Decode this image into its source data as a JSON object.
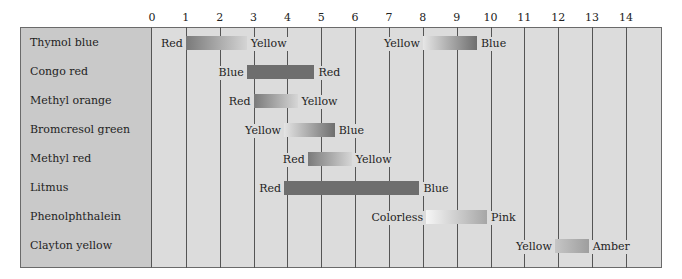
{
  "chart_data": {
    "type": "range-bar",
    "title": "",
    "xlabel": "pH",
    "ylabel": "",
    "xlim": [
      0,
      15
    ],
    "x_ticks": [
      0,
      1,
      2,
      3,
      4,
      5,
      6,
      7,
      8,
      9,
      10,
      11,
      12,
      13,
      14
    ],
    "grid": true,
    "legend": null,
    "indicators": [
      {
        "name": "Thymol blue",
        "ranges": [
          {
            "low": 1.0,
            "high": 2.8,
            "low_color_label": "Red",
            "high_color_label": "Yellow",
            "gradient": [
              "#7a7a7a",
              "#d4d4d4"
            ]
          },
          {
            "low": 8.0,
            "high": 9.6,
            "low_color_label": "Yellow",
            "high_color_label": "Blue",
            "gradient": [
              "#e6e6e6",
              "#6e6e6e"
            ]
          }
        ]
      },
      {
        "name": "Congo red",
        "ranges": [
          {
            "low": 2.8,
            "high": 4.8,
            "low_color_label": "Blue",
            "high_color_label": "Red",
            "gradient": [
              "#6e6e6e",
              "#6e6e6e"
            ]
          }
        ]
      },
      {
        "name": "Methyl orange",
        "ranges": [
          {
            "low": 3.0,
            "high": 4.3,
            "low_color_label": "Red",
            "high_color_label": "Yellow",
            "gradient": [
              "#7a7a7a",
              "#d6d6d6"
            ]
          }
        ]
      },
      {
        "name": "Bromcresol green",
        "ranges": [
          {
            "low": 3.9,
            "high": 5.4,
            "low_color_label": "Yellow",
            "high_color_label": "Blue",
            "gradient": [
              "#e4e4e4",
              "#6e6e6e"
            ]
          }
        ]
      },
      {
        "name": "Methyl red",
        "ranges": [
          {
            "low": 4.6,
            "high": 5.9,
            "low_color_label": "Red",
            "high_color_label": "Yellow",
            "gradient": [
              "#7a7a7a",
              "#d6d6d6"
            ]
          }
        ]
      },
      {
        "name": "Litmus",
        "ranges": [
          {
            "low": 3.9,
            "high": 7.9,
            "low_color_label": "Red",
            "high_color_label": "Blue",
            "gradient": [
              "#6e6e6e",
              "#6e6e6e"
            ]
          }
        ]
      },
      {
        "name": "Phenolphthalein",
        "ranges": [
          {
            "low": 8.1,
            "high": 9.9,
            "low_color_label": "Colorless",
            "high_color_label": "Pink",
            "gradient": [
              "#f6f6f6",
              "#a6a6a6"
            ]
          }
        ]
      },
      {
        "name": "Clayton yellow",
        "ranges": [
          {
            "low": 11.9,
            "high": 12.9,
            "low_color_label": "Yellow",
            "high_color_label": "Amber",
            "gradient": [
              "#c6c6c6",
              "#9e9e9e"
            ]
          }
        ]
      }
    ]
  },
  "layout": {
    "x0_px": 152,
    "px_per_unit": 33.85,
    "row_top_px": [
      36,
      65,
      94,
      123,
      152,
      181,
      210,
      239
    ]
  }
}
